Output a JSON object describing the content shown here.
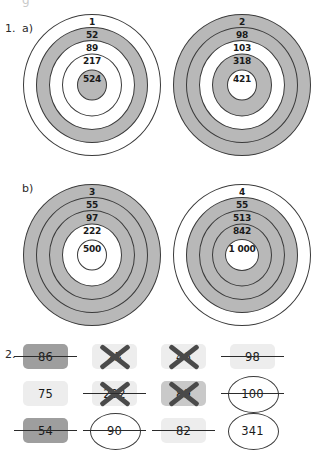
{
  "worksheet": {
    "ghost_top": "g",
    "exercise1": {
      "number": "1.",
      "parts": [
        {
          "letter": "a)",
          "targets": [
            {
              "name": "target-1",
              "labels": [
                "1",
                "52",
                "89",
                "217",
                "524"
              ],
              "ring_fills": [
                "white",
                "gray",
                "white",
                "white",
                "gray"
              ]
            },
            {
              "name": "target-2",
              "labels": [
                "2",
                "98",
                "103",
                "318",
                "421"
              ],
              "ring_fills": [
                "gray",
                "gray",
                "white",
                "gray",
                "white"
              ]
            }
          ]
        },
        {
          "letter": "b)",
          "targets": [
            {
              "name": "target-3",
              "labels": [
                "3",
                "55",
                "97",
                "222",
                "500"
              ],
              "ring_fills": [
                "gray",
                "gray",
                "gray",
                "white",
                "white"
              ]
            },
            {
              "name": "target-4",
              "labels": [
                "4",
                "55",
                "513",
                "842",
                "1 000"
              ],
              "ring_fills": [
                "white",
                "gray",
                "gray",
                "gray",
                "white"
              ]
            }
          ]
        }
      ]
    },
    "exercise2": {
      "number": "2.",
      "rows": [
        [
          {
            "value": "86",
            "chip": "dark",
            "strike": true,
            "cross": false,
            "circle": false
          },
          {
            "value": "23",
            "chip": "light",
            "strike": false,
            "cross": true,
            "circle": false
          },
          {
            "value": "46",
            "chip": "light",
            "strike": false,
            "cross": true,
            "circle": false
          },
          {
            "value": "98",
            "chip": "light",
            "strike": true,
            "cross": false,
            "circle": false
          }
        ],
        [
          {
            "value": "75",
            "chip": "light",
            "strike": false,
            "cross": false,
            "circle": false
          },
          {
            "value": "202",
            "chip": "light",
            "strike": true,
            "cross": true,
            "circle": false
          },
          {
            "value": "89",
            "chip": "mid",
            "strike": false,
            "cross": true,
            "circle": false
          },
          {
            "value": "100",
            "chip": "none",
            "strike": true,
            "cross": false,
            "circle": true
          }
        ],
        [
          {
            "value": "54",
            "chip": "dark",
            "strike": true,
            "cross": false,
            "circle": false
          },
          {
            "value": "90",
            "chip": "none",
            "strike": true,
            "cross": false,
            "circle": true
          },
          {
            "value": "82",
            "chip": "light",
            "strike": true,
            "cross": false,
            "circle": false
          },
          {
            "value": "341",
            "chip": "none",
            "strike": false,
            "cross": false,
            "circle": true
          }
        ]
      ]
    }
  }
}
